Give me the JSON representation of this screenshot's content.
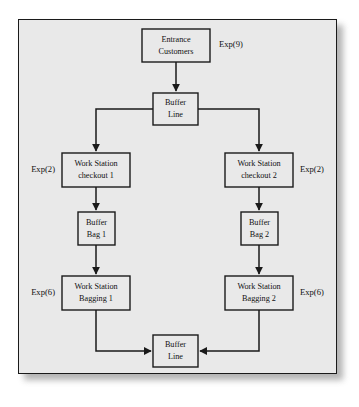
{
  "diagram": {
    "background_color": "#ffffff",
    "panel_color": "#e9e9e9",
    "line_color": "#1a1a1a",
    "nodes": [
      {
        "id": "entrance",
        "line1": "Entrance",
        "line2": "Customers"
      },
      {
        "id": "buffer_top",
        "line1": "Buffer",
        "line2": "Line"
      },
      {
        "id": "ws_check_1",
        "line1": "Work Station",
        "line2": "checkout 1"
      },
      {
        "id": "ws_check_2",
        "line1": "Work Station",
        "line2": "checkout 2"
      },
      {
        "id": "bag_buf_1",
        "line1": "Buffer",
        "line2": "Bag 1"
      },
      {
        "id": "bag_buf_2",
        "line1": "Buffer",
        "line2": "Bag 2"
      },
      {
        "id": "ws_bag_1",
        "line1": "Work Station",
        "line2": "Bagging 1"
      },
      {
        "id": "ws_bag_2",
        "line1": "Work Station",
        "line2": "Bagging 2"
      },
      {
        "id": "buffer_bot",
        "line1": "Buffer",
        "line2": "Line"
      }
    ],
    "rate_labels": [
      {
        "id": "rate_entrance",
        "text": "Exp(9)"
      },
      {
        "id": "rate_checkout_1",
        "text": "Exp(2)"
      },
      {
        "id": "rate_checkout_2",
        "text": "Exp(2)"
      },
      {
        "id": "rate_bagging_1",
        "text": "Exp(6)"
      },
      {
        "id": "rate_bagging_2",
        "text": "Exp(6)"
      }
    ]
  }
}
